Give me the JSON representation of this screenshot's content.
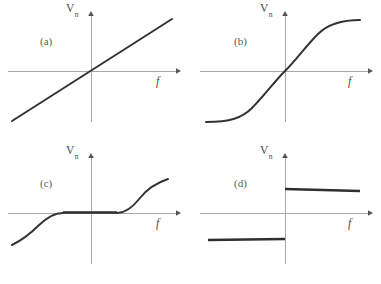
{
  "figure": {
    "axis_labels": {
      "y_main": "V",
      "y_sub": "n",
      "y_full": "Vn",
      "x": "f"
    },
    "colors": {
      "axis": "#a9a9a9",
      "curve": "#333333",
      "text": "#4a4a4a",
      "background": "#ffffff"
    }
  },
  "panels": [
    {
      "tag": "(a)",
      "name": "linear",
      "description": "Straight line through origin with positive slope",
      "origin": {
        "x": 91,
        "y": 71
      },
      "x_axis": {
        "x1": 8,
        "x2": 176,
        "y": 71
      },
      "y_axis": {
        "x": 91,
        "y1": 14,
        "y2": 122
      },
      "x_label_pos": {
        "x": 156,
        "y": 76
      },
      "y_label_pos": {
        "x": 66,
        "y": 3
      },
      "tag_pos": {
        "x": 40,
        "y": 36
      },
      "path": "M 12 121 L 172 19"
    },
    {
      "tag": "(b)",
      "name": "sigmoid",
      "description": "S-shaped saturating curve through origin",
      "origin": {
        "x": 95,
        "y": 71
      },
      "x_axis": {
        "x1": 10,
        "x2": 178,
        "y": 71
      },
      "y_axis": {
        "x": 95,
        "y1": 14,
        "y2": 122
      },
      "x_label_pos": {
        "x": 158,
        "y": 76
      },
      "y_label_pos": {
        "x": 70,
        "y": 3
      },
      "tag_pos": {
        "x": 44,
        "y": 36
      },
      "path": "M 16 122 C 40 122 52 118 62 108 C 74 96 84 82 95 71 C 106 60 116 46 128 34 C 138 24 152 20 170 20"
    },
    {
      "tag": "(c)",
      "name": "dead-zone",
      "description": "Flat dead band near origin with square-root branches outside",
      "origin": {
        "x": 91,
        "y": 71
      },
      "x_axis": {
        "x1": 8,
        "x2": 176,
        "y": 71
      },
      "y_axis": {
        "x": 91,
        "y1": 14,
        "y2": 122
      },
      "x_label_pos": {
        "x": 156,
        "y": 76
      },
      "y_label_pos": {
        "x": 66,
        "y": 3
      },
      "tag_pos": {
        "x": 40,
        "y": 36
      },
      "deadzone": {
        "x_left": 63,
        "x_right": 117,
        "y": 71
      },
      "path_left": "M 63 71 C 54 71 46 76 38 84 C 30 92 22 98 12 103",
      "path_right": "M 117 71 C 126 71 133 65 140 56 C 147 47 156 41 168 37",
      "path_flat": "M 63 70.5 L 117 70.5"
    },
    {
      "tag": "(d)",
      "name": "sign-step",
      "description": "Discontinuous sign function: negative constant then positive constant",
      "origin": {
        "x": 95,
        "y": 71
      },
      "x_axis": {
        "x1": 10,
        "x2": 178,
        "y": 71
      },
      "y_axis": {
        "x": 95,
        "y1": 14,
        "y2": 122
      },
      "x_label_pos": {
        "x": 158,
        "y": 76
      },
      "y_label_pos": {
        "x": 70,
        "y": 3
      },
      "tag_pos": {
        "x": 44,
        "y": 36
      },
      "path_upper": "M 95 47 L 170 49",
      "path_lower": "M 18 98 L 95 97"
    }
  ],
  "chart_data": {
    "type": "line",
    "xlabel": "f",
    "ylabel": "Vn",
    "grid": false,
    "legend": "none",
    "xlim": [
      -1,
      1
    ],
    "ylim": [
      -1,
      1
    ],
    "subplots": [
      {
        "tag": "(a)",
        "name": "linear",
        "x": [
          -1.0,
          -0.75,
          -0.5,
          -0.25,
          0.0,
          0.25,
          0.5,
          0.75,
          1.0
        ],
        "y": [
          -0.72,
          -0.54,
          -0.36,
          -0.18,
          0.0,
          0.18,
          0.36,
          0.54,
          0.72
        ]
      },
      {
        "tag": "(b)",
        "name": "sigmoid",
        "x": [
          -1.0,
          -0.75,
          -0.5,
          -0.25,
          0.0,
          0.25,
          0.5,
          0.75,
          1.0
        ],
        "y": [
          -0.95,
          -0.88,
          -0.66,
          -0.35,
          0.0,
          0.35,
          0.66,
          0.88,
          0.95
        ]
      },
      {
        "tag": "(c)",
        "name": "dead-zone",
        "x": [
          -1.0,
          -0.75,
          -0.5,
          -0.32,
          -0.3,
          0.0,
          0.3,
          0.32,
          0.5,
          0.75,
          1.0
        ],
        "y": [
          -0.62,
          -0.48,
          -0.26,
          0.0,
          0.0,
          0.0,
          0.0,
          0.0,
          0.29,
          0.5,
          0.65
        ]
      },
      {
        "tag": "(d)",
        "name": "sign-step",
        "x": [
          -1.0,
          -0.5,
          -0.01,
          0.0,
          0.01,
          0.5,
          1.0
        ],
        "y": [
          -0.49,
          -0.49,
          -0.48,
          null,
          0.45,
          0.44,
          0.43
        ]
      }
    ]
  }
}
